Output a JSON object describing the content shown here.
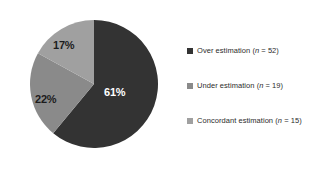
{
  "chart_data": {
    "type": "pie",
    "title": "",
    "categories": [
      "Over estimation",
      "Under estimation",
      "Concordant estimation"
    ],
    "values": [
      61,
      22,
      17
    ],
    "counts": [
      52,
      19,
      15
    ],
    "value_labels": [
      "61%",
      "22%",
      "17%"
    ],
    "colors": [
      "#333333",
      "#8a8a8a",
      "#a0a0a0"
    ],
    "legend_position": "right",
    "grid": false,
    "start_angle_deg": 0,
    "direction": "clockwise",
    "background": "#ffffff"
  },
  "pie": {
    "slices": [
      {
        "key": "over",
        "label": "Over estimation",
        "percent_label": "61%",
        "percent": 61,
        "count": 52,
        "color": "#333333",
        "label_color": "#ffffff"
      },
      {
        "key": "under",
        "label": "Under estimation",
        "percent_label": "22%",
        "percent": 22,
        "count": 19,
        "color": "#8a8a8a",
        "label_color": "#1c1c1c"
      },
      {
        "key": "concordant",
        "label": "Concordant estimation",
        "percent_label": "17%",
        "percent": 17,
        "count": 15,
        "color": "#a0a0a0",
        "label_color": "#1c1c1c"
      }
    ]
  },
  "legend": {
    "items": [
      {
        "name": "Over estimation",
        "prefix": "Over estimation (",
        "n_symbol": "n",
        "suffix": " = 52)",
        "color": "#333333"
      },
      {
        "name": "Under estimation",
        "prefix": "Under estimation (",
        "n_symbol": "n",
        "suffix": " = 19)",
        "color": "#8a8a8a"
      },
      {
        "name": "Concordant estimation",
        "prefix": "Concordant estimation (",
        "n_symbol": "n",
        "suffix": " = 15)",
        "color": "#a0a0a0"
      }
    ]
  }
}
